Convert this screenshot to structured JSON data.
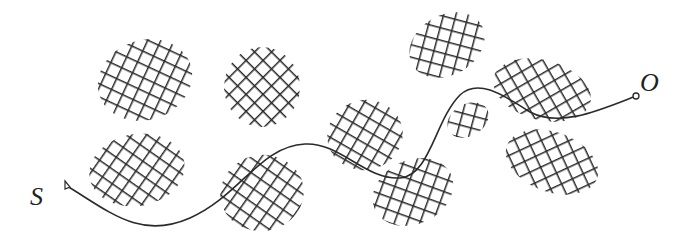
{
  "diagram": {
    "type": "path-planning-obstacles",
    "start_label": "S",
    "goal_label": "O",
    "colors": {
      "ink": "#2a2a2a",
      "background": "#ffffff"
    },
    "obstacles": [
      {
        "id": "o1",
        "cx": 145,
        "cy": 80,
        "rx": 48,
        "ry": 40,
        "rot": -20
      },
      {
        "id": "o2",
        "cx": 262,
        "cy": 87,
        "rx": 38,
        "ry": 40,
        "rot": 0
      },
      {
        "id": "o3",
        "cx": 137,
        "cy": 170,
        "rx": 48,
        "ry": 36,
        "rot": -10
      },
      {
        "id": "o4",
        "cx": 262,
        "cy": 193,
        "rx": 42,
        "ry": 38,
        "rot": -10
      },
      {
        "id": "o5",
        "cx": 365,
        "cy": 135,
        "rx": 38,
        "ry": 35,
        "rot": -15
      },
      {
        "id": "o6",
        "cx": 447,
        "cy": 45,
        "rx": 40,
        "ry": 30,
        "rot": -30
      },
      {
        "id": "o7",
        "cx": 413,
        "cy": 192,
        "rx": 42,
        "ry": 32,
        "rot": -25
      },
      {
        "id": "o8",
        "cx": 468,
        "cy": 120,
        "rx": 22,
        "ry": 16,
        "rot": -30
      },
      {
        "id": "o9",
        "cx": 542,
        "cy": 90,
        "rx": 50,
        "ry": 30,
        "rot": 15
      },
      {
        "id": "o10",
        "cx": 552,
        "cy": 162,
        "rx": 48,
        "ry": 30,
        "rot": 20
      }
    ],
    "path": {
      "d": "M 67 186 C 110 212, 140 240, 190 218 C 240 196, 260 146, 305 144 C 340 142, 365 180, 400 178 C 430 176, 435 120, 460 95 C 480 76, 510 100, 530 112 C 560 128, 600 110, 636 96",
      "start": {
        "x": 67,
        "y": 186
      },
      "end": {
        "x": 636,
        "y": 96
      }
    }
  }
}
